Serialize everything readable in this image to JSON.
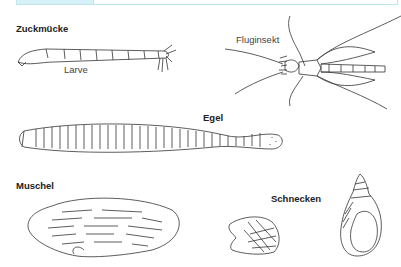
{
  "header_table": {
    "accent_color": "#d6f1f7",
    "border_color": "#bfe6ef"
  },
  "sections": [
    {
      "title": "Zuckmücke",
      "captions": [
        "Larve",
        "Fluginsekt"
      ]
    },
    {
      "title": "Egel"
    },
    {
      "title": "Muschel"
    },
    {
      "title": "Schnecken"
    }
  ]
}
